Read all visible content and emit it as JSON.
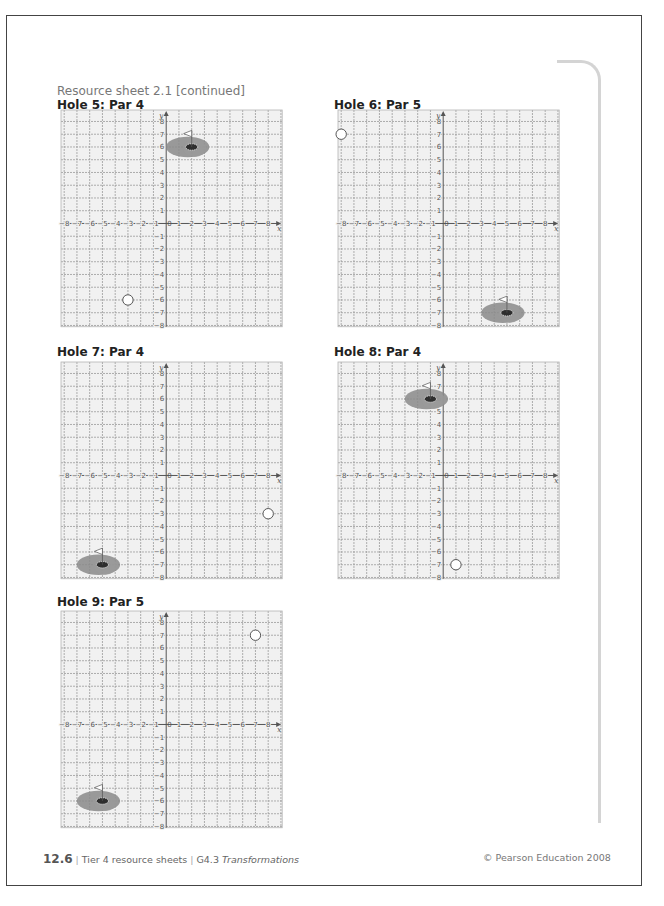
{
  "sheet": {
    "title": "Resource sheet 2.1 [continued]"
  },
  "grid_spec": {
    "x_min": -8,
    "x_max": 8,
    "y_min": -8,
    "y_max": 8,
    "x_label": "x",
    "y_label": "y",
    "origin_label": "0",
    "unit_px": 12.75
  },
  "holes": [
    {
      "heading": "Hole 5: Par 4",
      "left": 61,
      "top": 110,
      "heading_left": 57,
      "heading_top": 98,
      "ball": {
        "x": -3,
        "y": -6
      },
      "green": {
        "x": 2,
        "y": 6
      }
    },
    {
      "heading": "Hole 6: Par 5",
      "left": 338,
      "top": 110,
      "heading_left": 334,
      "heading_top": 98,
      "ball": {
        "x": -8,
        "y": 7
      },
      "green": {
        "x": 5,
        "y": -7
      }
    },
    {
      "heading": "Hole 7: Par 4",
      "left": 61,
      "top": 362,
      "heading_left": 57,
      "heading_top": 345,
      "ball": {
        "x": 8,
        "y": -3
      },
      "green": {
        "x": -5,
        "y": -7
      }
    },
    {
      "heading": "Hole 8: Par 4",
      "left": 338,
      "top": 362,
      "heading_left": 334,
      "heading_top": 345,
      "ball": {
        "x": 1,
        "y": -7
      },
      "green": {
        "x": -1,
        "y": 6
      }
    },
    {
      "heading": "Hole 9: Par 5",
      "left": 61,
      "top": 611,
      "heading_left": 57,
      "heading_top": 595,
      "ball": {
        "x": 7,
        "y": 7
      },
      "green": {
        "x": -5,
        "y": -6
      }
    }
  ],
  "footer": {
    "page_number": "12.6",
    "section": "Tier 4 resource sheets",
    "topic_code": "G4.3",
    "topic_name": "Transformations",
    "copyright": "© Pearson Education 2008"
  },
  "colors": {
    "page_border": "#444444",
    "grid_line": "#9a9a9a",
    "grid_fill": "#f1f1f1",
    "axis": "#555555",
    "green_fill": "#8a8a8a",
    "margin_line": "#d4d4d4"
  }
}
